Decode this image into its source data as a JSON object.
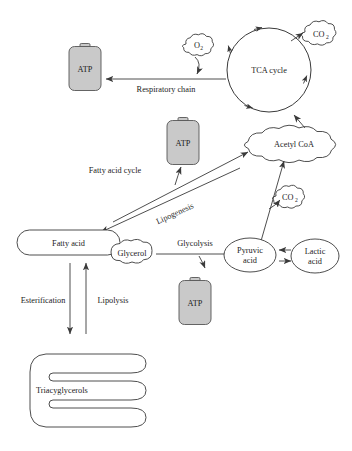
{
  "diagram": {
    "background_color": "#ffffff",
    "line_color": "#3a3a3a",
    "battery_fill": "#c9c9c9",
    "nodes": {
      "atp_respiratory": {
        "label": "ATP",
        "icon": "battery-icon"
      },
      "atp_fatty_acid": {
        "label": "ATP",
        "icon": "battery-icon"
      },
      "atp_glycolysis": {
        "label": "ATP",
        "icon": "battery-icon"
      },
      "oxygen": {
        "label": "O",
        "subscript": "2",
        "icon": "cloud-icon"
      },
      "co2_tca": {
        "label": "CO",
        "subscript": "2",
        "icon": "cloud-icon"
      },
      "co2_pyruvate": {
        "label": "CO",
        "subscript": "2",
        "icon": "cloud-icon"
      },
      "tca_cycle": {
        "label": "TCA cycle",
        "icon": "cycle-icon"
      },
      "acetyl_coa": {
        "label": "Acetyl CoA",
        "icon": "cloud-icon"
      },
      "fatty_acid": {
        "label": "Fatty acid",
        "icon": "pill-icon"
      },
      "glycerol": {
        "label": "Glycerol",
        "icon": "blob-icon"
      },
      "pyruvic_acid": {
        "label_line1": "Pyruvic",
        "label_line2": "acid",
        "icon": "ellipse-icon"
      },
      "lactic_acid": {
        "label_line1": "Lactic",
        "label_line2": "acid",
        "icon": "ellipse-icon"
      },
      "triacyglycerols": {
        "label": "Triacyglycerols",
        "icon": "comb-icon"
      }
    },
    "edge_labels": {
      "respiratory_chain": "Respiratory chain",
      "fatty_acid_cycle": "Fatty acid cycle",
      "lipogenesis": "Lipogenesis",
      "glycolysis": "Glycolysis",
      "esterification": "Esterification",
      "lipolysis": "Lipolysis"
    }
  }
}
